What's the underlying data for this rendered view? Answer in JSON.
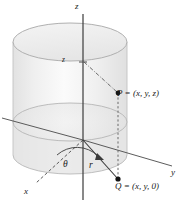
{
  "axes": {
    "z_label": "z",
    "x_label": "x",
    "y_label": "y",
    "z_tick_label": "z"
  },
  "points": {
    "P_label": "P = (x, y, z)",
    "Q_label": "Q = (x, y, 0)"
  },
  "measures": {
    "theta_label": "θ",
    "r_label": "r"
  },
  "colors": {
    "stroke": "#333333",
    "cylinder_fill": "#ededed",
    "cylinder_fill_light": "#f6f6f6",
    "cylinder_edge": "#bbbbbb",
    "guide": "#555555",
    "background": "#ffffff",
    "text": "#1a1a1a"
  }
}
